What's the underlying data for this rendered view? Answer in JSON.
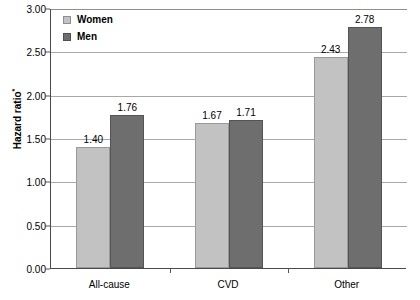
{
  "chart_data": {
    "type": "bar",
    "title": "",
    "xlabel": "",
    "ylabel": "Hazard ratio",
    "ylabel_superscript": "*",
    "categories": [
      "All-cause",
      "CVD",
      "Other"
    ],
    "series": [
      {
        "name": "Women",
        "color": "#c2c2c2",
        "values": [
          1.4,
          1.67,
          2.43
        ],
        "labels": [
          "1.40",
          "1.67",
          "2.43"
        ]
      },
      {
        "name": "Men",
        "color": "#6e6e6e",
        "values": [
          1.76,
          1.71,
          2.78
        ],
        "labels": [
          "1.76",
          "1.71",
          "2.78"
        ]
      }
    ],
    "ylim": [
      0,
      3.0
    ],
    "ytick_step": 0.5,
    "ytick_labels": [
      "0.00",
      "0.50",
      "1.00",
      "1.50",
      "2.00",
      "2.50",
      "3.00"
    ],
    "ytick_values": [
      0,
      0.5,
      1.0,
      1.5,
      2.0,
      2.5,
      3.0
    ],
    "grid": true,
    "legend_position": "top-left-inside"
  },
  "legend": {
    "items": [
      {
        "label": "Women"
      },
      {
        "label": "Men"
      }
    ]
  },
  "axis": {
    "y_title": "Hazard ratio",
    "y_title_superscript": "*"
  }
}
